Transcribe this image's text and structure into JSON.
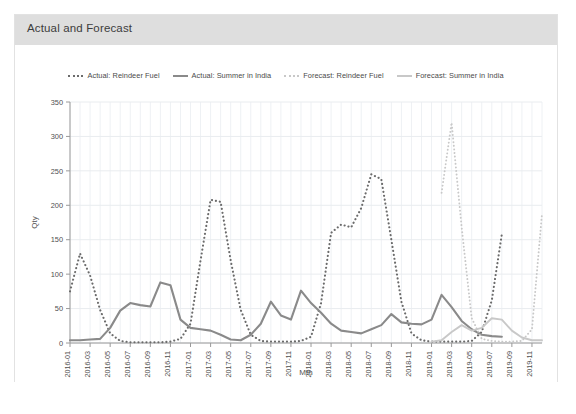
{
  "card": {
    "title": "Actual and Forecast"
  },
  "chart_data": {
    "type": "line",
    "title": "Actual and Forecast",
    "xlabel": "Mth",
    "ylabel": "Qty",
    "ylim": [
      0,
      350
    ],
    "yticks": [
      0,
      50,
      100,
      150,
      200,
      250,
      300,
      350
    ],
    "grid": true,
    "legend_position": "top-center",
    "x": [
      "2016-01",
      "2016-02",
      "2016-03",
      "2016-04",
      "2016-05",
      "2016-06",
      "2016-07",
      "2016-08",
      "2016-09",
      "2016-10",
      "2016-11",
      "2016-12",
      "2017-01",
      "2017-02",
      "2017-03",
      "2017-04",
      "2017-05",
      "2017-06",
      "2017-07",
      "2017-08",
      "2017-09",
      "2017-10",
      "2017-11",
      "2017-12",
      "2018-01",
      "2018-02",
      "2018-03",
      "2018-04",
      "2018-05",
      "2018-06",
      "2018-07",
      "2018-08",
      "2018-09",
      "2018-10",
      "2018-11",
      "2018-12",
      "2019-01",
      "2019-02",
      "2019-03",
      "2019-04",
      "2019-05",
      "2019-06",
      "2019-07",
      "2019-08",
      "2019-09",
      "2019-10",
      "2019-11",
      "2019-12"
    ],
    "xtick_labels": [
      "2016-01",
      "2016-03",
      "2016-05",
      "2016-07",
      "2016-09",
      "2016-11",
      "2017-01",
      "2017-03",
      "2017-05",
      "2017-07",
      "2017-09",
      "2017-11",
      "2018-01",
      "2018-03",
      "2018-05",
      "2018-07",
      "2018-09",
      "2018-11",
      "2019-01",
      "2019-03",
      "2019-05",
      "2019-07",
      "2019-09",
      "2019-11"
    ],
    "series": [
      {
        "name": "Actual: Reindeer Fuel",
        "style": "dotted",
        "color": "#6b6b6b",
        "width": 2.1,
        "values": [
          75,
          130,
          98,
          48,
          14,
          3,
          1,
          1,
          1,
          1,
          2,
          6,
          28,
          120,
          208,
          205,
          120,
          48,
          12,
          3,
          2,
          2,
          2,
          3,
          9,
          58,
          160,
          172,
          168,
          196,
          245,
          238,
          150,
          60,
          14,
          4,
          2,
          2,
          2,
          2,
          3,
          16,
          62,
          158,
          null,
          null,
          null,
          null
        ]
      },
      {
        "name": "Actual: Summer in India",
        "style": "solid",
        "color": "#8a8a8a",
        "width": 2.1,
        "values": [
          4,
          4,
          5,
          6,
          22,
          47,
          58,
          55,
          53,
          88,
          84,
          34,
          22,
          20,
          18,
          12,
          5,
          4,
          12,
          28,
          60,
          40,
          34,
          76,
          58,
          44,
          28,
          18,
          16,
          14,
          20,
          26,
          42,
          30,
          28,
          27,
          34,
          70,
          52,
          32,
          20,
          12,
          10,
          9,
          null,
          null,
          null,
          null
        ]
      },
      {
        "name": "Forecast: Reindeer Fuel",
        "style": "dotted",
        "color": "#c8c8c8",
        "width": 1.9,
        "values": [
          null,
          null,
          null,
          null,
          null,
          null,
          null,
          null,
          null,
          null,
          null,
          null,
          null,
          null,
          null,
          null,
          null,
          null,
          null,
          null,
          null,
          null,
          null,
          null,
          null,
          null,
          null,
          null,
          null,
          null,
          null,
          null,
          null,
          null,
          null,
          null,
          null,
          218,
          320,
          168,
          36,
          6,
          3,
          2,
          2,
          3,
          20,
          188
        ]
      },
      {
        "name": "Forecast: Summer in India",
        "style": "solid",
        "color": "#c8c8c8",
        "width": 1.9,
        "values": [
          null,
          null,
          null,
          null,
          null,
          null,
          null,
          null,
          null,
          null,
          null,
          null,
          null,
          null,
          null,
          null,
          null,
          null,
          null,
          null,
          null,
          null,
          null,
          null,
          null,
          null,
          null,
          null,
          null,
          null,
          null,
          null,
          null,
          null,
          null,
          null,
          2,
          4,
          16,
          26,
          18,
          22,
          36,
          34,
          18,
          8,
          4,
          4
        ]
      }
    ]
  },
  "legend": {
    "items": [
      {
        "label": "Actual: Reindeer Fuel",
        "style": "dotted",
        "color": "#6b6b6b"
      },
      {
        "label": "Actual: Summer in India",
        "style": "solid",
        "color": "#8a8a8a"
      },
      {
        "label": "Forecast: Reindeer Fuel",
        "style": "dotted",
        "color": "#c8c8c8"
      },
      {
        "label": "Forecast: Summer in India",
        "style": "solid",
        "color": "#c8c8c8"
      }
    ]
  }
}
